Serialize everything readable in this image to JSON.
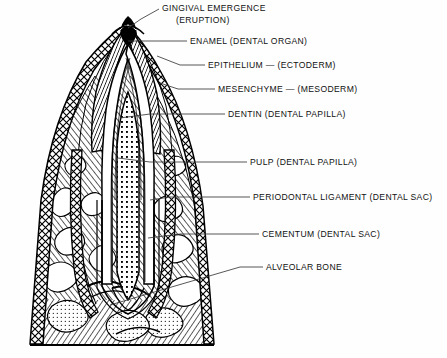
{
  "figure": {
    "background_color": "#ffffff",
    "ink_color": "#000000",
    "leader_color": "#3a3a3a"
  },
  "labels": [
    {
      "id": "gingival-emergence",
      "line1": "GINGIVAL EMERGENCE",
      "line2": "(ERUPTION)",
      "text_x": 162,
      "text_y": 11,
      "text_y2": 23,
      "leader": "M 159 9 L 141 19 L 128 28"
    },
    {
      "id": "enamel",
      "line1": "ENAMEL (DENTAL ORGAN)",
      "line2": "",
      "text_x": 190,
      "text_y": 44,
      "leader": "M 187 41 L 128 41"
    },
    {
      "id": "epithelium",
      "line1": "EPITHELIUM — (ECTODERM)",
      "line2": "",
      "text_x": 208,
      "text_y": 68,
      "leader": "M 205 65 L 180 65 L 157 56"
    },
    {
      "id": "mesenchyme",
      "line1": "MESENCHYME — (MESODERM)",
      "line2": "",
      "text_x": 218,
      "text_y": 92,
      "leader": "M 215 89 L 178 89 L 160 83"
    },
    {
      "id": "dentin",
      "line1": "DENTIN (DENTAL PAPILLA)",
      "line2": "",
      "text_x": 228,
      "text_y": 117,
      "leader": "M 225 114 L 150 114 L 120 118"
    },
    {
      "id": "pulp",
      "line1": "PULP (DENTAL PAPILLA)",
      "line2": "",
      "text_x": 250,
      "text_y": 165,
      "leader": "M 247 162 L 150 162 L 118 158"
    },
    {
      "id": "periodontal-ligament",
      "line1": "PERIODONTAL LIGAMENT (DENTAL SAC)",
      "line2": "",
      "text_x": 253,
      "text_y": 200,
      "leader": "M 250 197 L 170 197 L 150 200"
    },
    {
      "id": "cementum",
      "line1": "CEMENTUM (DENTAL SAC)",
      "line2": "",
      "text_x": 262,
      "text_y": 237,
      "leader": "M 259 234 L 180 234 L 148 238"
    },
    {
      "id": "alveolar-bone",
      "line1": "ALVEOLAR BONE",
      "line2": "",
      "text_x": 266,
      "text_y": 270,
      "leader": "M 263 267 L 240 267 L 110 305"
    }
  ],
  "structures": [
    {
      "id": "gingiva-epithelium",
      "name": "Gingival epithelium (ectoderm)",
      "pattern": "diamond-mesh"
    },
    {
      "id": "enamel-organ",
      "name": "Enamel / dental organ",
      "pattern": "dense-diagonal-hatch"
    },
    {
      "id": "dentin-layer",
      "name": "Dentin (dental papilla)",
      "pattern": "smooth-banded"
    },
    {
      "id": "pulp-chamber",
      "name": "Pulp (dental papilla)",
      "pattern": "stipple"
    },
    {
      "id": "periodontal-ligament-band",
      "name": "Periodontal ligament (dental sac)",
      "pattern": "diamond-mesh"
    },
    {
      "id": "cementum-layer",
      "name": "Cementum (dental sac)",
      "pattern": "thin-outline"
    },
    {
      "id": "alveolar-bone-body",
      "name": "Alveolar bone",
      "pattern": "trabecular-hatch"
    }
  ]
}
